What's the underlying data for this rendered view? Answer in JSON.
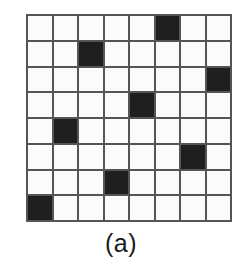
{
  "figure": {
    "caption": "(a)",
    "colors": {
      "filled_cell": "#1f1f1f",
      "empty_cell": "#fbfbfb",
      "grid_line": "#555555",
      "background": "#ffffff",
      "caption_text": "#1a1a1a"
    }
  },
  "chart_data": {
    "type": "heatmap",
    "title": "(a)",
    "xlabel": "",
    "ylabel": "",
    "rows": 8,
    "cols": 8,
    "grid": true,
    "legend": "none",
    "value_labels": {
      "0": "empty",
      "1": "filled"
    },
    "row_labels": [
      "1",
      "2",
      "3",
      "4",
      "5",
      "6",
      "7",
      "8"
    ],
    "col_labels": [
      "1",
      "2",
      "3",
      "4",
      "5",
      "6",
      "7",
      "8"
    ],
    "filled_cells_row_col": [
      [
        1,
        6
      ],
      [
        2,
        3
      ],
      [
        3,
        8
      ],
      [
        4,
        5
      ],
      [
        5,
        2
      ],
      [
        6,
        7
      ],
      [
        7,
        4
      ],
      [
        8,
        1
      ]
    ],
    "values": [
      [
        0,
        0,
        0,
        0,
        0,
        1,
        0,
        0
      ],
      [
        0,
        0,
        1,
        0,
        0,
        0,
        0,
        0
      ],
      [
        0,
        0,
        0,
        0,
        0,
        0,
        0,
        1
      ],
      [
        0,
        0,
        0,
        0,
        1,
        0,
        0,
        0
      ],
      [
        0,
        1,
        0,
        0,
        0,
        0,
        0,
        0
      ],
      [
        0,
        0,
        0,
        0,
        0,
        0,
        1,
        0
      ],
      [
        0,
        0,
        0,
        1,
        0,
        0,
        0,
        0
      ],
      [
        1,
        0,
        0,
        0,
        0,
        0,
        0,
        0
      ]
    ]
  }
}
